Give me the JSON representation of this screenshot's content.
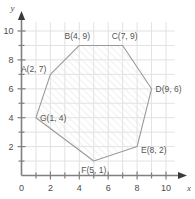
{
  "chart_data": {
    "type": "scatter",
    "title": "",
    "subtitle": "",
    "xlabel": "x",
    "ylabel": "y",
    "xlim": [
      0,
      10.6
    ],
    "ylim": [
      0,
      10.6
    ],
    "grid": true,
    "legend": null,
    "x_ticks_major": [
      0,
      2,
      4,
      6,
      8,
      10
    ],
    "x_tick_labels": [
      "0",
      "2",
      "4",
      "6",
      "8",
      "10"
    ],
    "x_ticks_minor": [
      1,
      3,
      5,
      7,
      9
    ],
    "y_ticks_major": [
      0,
      2,
      4,
      6,
      8,
      10
    ],
    "y_tick_labels": [
      "0",
      "2",
      "4",
      "6",
      "8",
      "10"
    ],
    "y_ticks_minor": [
      1,
      3,
      5,
      7,
      9
    ],
    "shape": "heptagon",
    "fill": "diagonal-hatch",
    "vertices": [
      {
        "name": "A",
        "x": 2,
        "y": 7,
        "label": "A(2, 7)",
        "label_anchor": "end",
        "label_dx": -4,
        "label_dy": -2
      },
      {
        "name": "B",
        "x": 4,
        "y": 9,
        "label": "B(4, 9)",
        "label_anchor": "middle",
        "label_dx": -2,
        "label_dy": -6
      },
      {
        "name": "C",
        "x": 7,
        "y": 9,
        "label": "C(7, 9)",
        "label_anchor": "middle",
        "label_dx": 2,
        "label_dy": -6
      },
      {
        "name": "D",
        "x": 9,
        "y": 6,
        "label": "D(9, 6)",
        "label_anchor": "start",
        "label_dx": 4,
        "label_dy": 3
      },
      {
        "name": "E",
        "x": 8,
        "y": 2,
        "label": "E(8, 2)",
        "label_anchor": "start",
        "label_dx": 4,
        "label_dy": 6
      },
      {
        "name": "F",
        "x": 5,
        "y": 1,
        "label": "F(5, 1)",
        "label_anchor": "middle",
        "label_dx": 0,
        "label_dy": 12
      },
      {
        "name": "G",
        "x": 1,
        "y": 4,
        "label": "G(1, 4)",
        "label_anchor": "start",
        "label_dx": 4,
        "label_dy": 3
      }
    ],
    "colors": {
      "grid": "#e2e2e2",
      "axis": "#808080",
      "outline": "#9a9a9a",
      "hatch": "#e6e6e6",
      "label_text": "#555555",
      "tick_text": "#4d4d4d",
      "background": "#ffffff"
    }
  },
  "axes": {
    "x_name": "x",
    "y_name": "y"
  }
}
